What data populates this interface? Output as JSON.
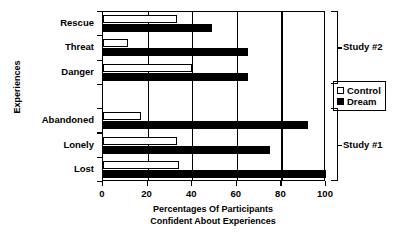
{
  "chart_data": {
    "type": "bar",
    "orientation": "horizontal",
    "title": "",
    "xlabel": "Percentages Of Participants Confident About Experiences",
    "xlabel_lines": [
      "Percentages Of Participants",
      "Confident About Experiences"
    ],
    "ylabel": "Experiences",
    "xlim": [
      0,
      100
    ],
    "xticks": [
      0,
      20,
      40,
      60,
      80,
      100
    ],
    "xtick_labels": [
      "0",
      "20",
      "40",
      "60",
      "80",
      "100"
    ],
    "grid": true,
    "grid_axis": "x",
    "legend_position": "right",
    "categories": [
      "Rescue",
      "Threat",
      "Danger",
      "Abandoned",
      "Lonely",
      "Lost"
    ],
    "series": [
      {
        "name": "Control",
        "color": "#ffffff",
        "values": [
          33,
          11,
          40,
          17,
          33,
          34
        ]
      },
      {
        "name": "Dream",
        "color": "#000000",
        "values": [
          49,
          65,
          65,
          92,
          75,
          100
        ]
      }
    ],
    "annotations": [
      {
        "label": "Study #2",
        "categories": [
          "Rescue",
          "Threat",
          "Danger"
        ]
      },
      {
        "label": "Study #1",
        "categories": [
          "Abandoned",
          "Lonely",
          "Lost"
        ]
      }
    ]
  },
  "legend": {
    "items": [
      {
        "label": "Control",
        "swatch": "open-square-icon"
      },
      {
        "label": "Dream",
        "swatch": "filled-square-icon"
      }
    ]
  }
}
